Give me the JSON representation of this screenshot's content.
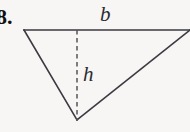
{
  "figure": {
    "problem_number": "8.",
    "background_color": "#f7f6f4",
    "stroke_color": "#3a3a40",
    "dash_color": "#55555a",
    "labels": {
      "base": "b",
      "height": "h"
    },
    "geometry": {
      "shape": "triangle",
      "orientation": "apex-down",
      "vertices": {
        "top_left": [
          24,
          30
        ],
        "top_right": [
          190,
          30
        ],
        "bottom_apex": [
          77,
          120
        ]
      },
      "base_segment": [
        [
          24,
          30
        ],
        [
          190,
          30
        ]
      ],
      "height_segment": [
        [
          77,
          30
        ],
        [
          77,
          120
        ]
      ],
      "height_line_style": "dashed",
      "base_label_position": [
        108,
        14
      ],
      "height_label_position": [
        89,
        74
      ]
    }
  }
}
